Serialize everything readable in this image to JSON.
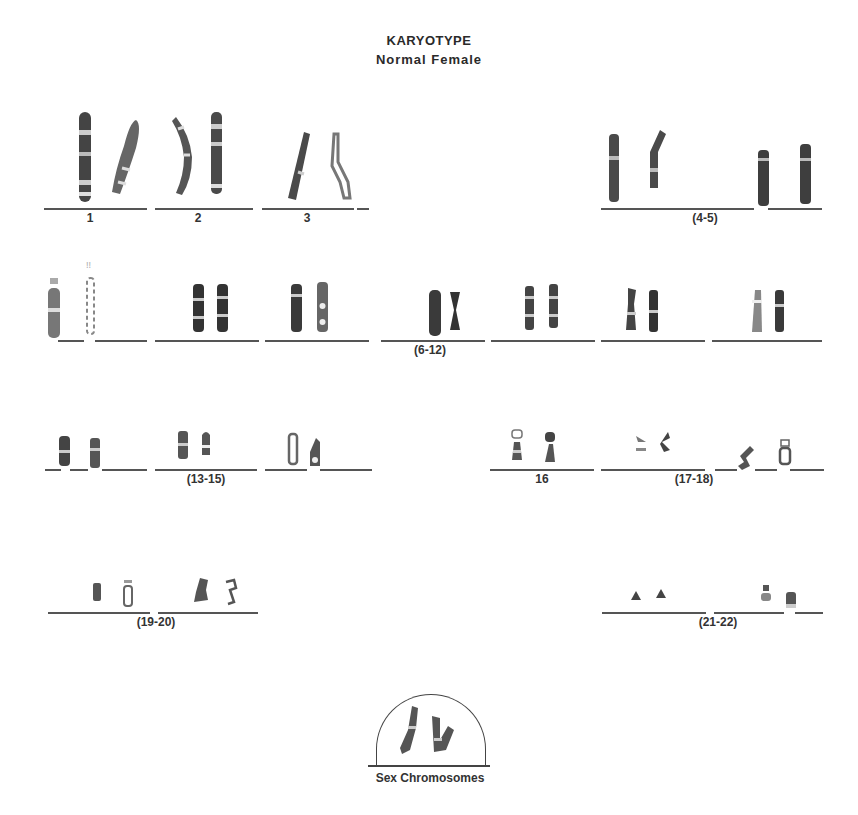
{
  "header": {
    "title": "KARYOTYPE",
    "subtitle": "Normal Female"
  },
  "groups": [
    {
      "label": "1",
      "row": 1
    },
    {
      "label": "2",
      "row": 1
    },
    {
      "label": "3",
      "row": 1
    },
    {
      "label": "(4-5)",
      "row": 1
    },
    {
      "label": "(6-12)",
      "row": 2
    },
    {
      "label": "(13-15)",
      "row": 3
    },
    {
      "label": "16",
      "row": 3
    },
    {
      "label": "(17-18)",
      "row": 3
    },
    {
      "label": "(19-20)",
      "row": 4
    },
    {
      "label": "(21-22)",
      "row": 4
    }
  ],
  "sex_chromosomes": {
    "label": "Sex Chromosomes"
  },
  "colors": {
    "chromosome_dark": "#3a3a3a",
    "chromosome_light": "#9a9a9a",
    "line": "#555555",
    "background": "#ffffff"
  }
}
